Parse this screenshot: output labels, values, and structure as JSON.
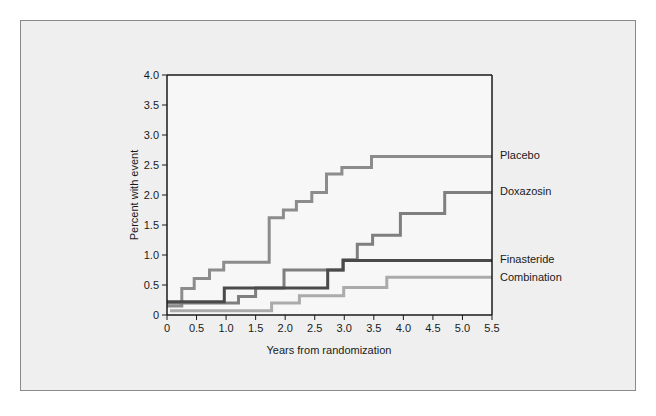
{
  "chart_data": {
    "type": "line",
    "subtype": "step (Kaplan-Meier cumulative incidence)",
    "title": "",
    "xlabel": "Years from randomization",
    "ylabel": "Percent with event",
    "xlim": [
      0,
      5.5
    ],
    "ylim": [
      0,
      4.0
    ],
    "x_ticks": [
      "0",
      "0.5",
      "1.0",
      "1.5",
      "2.0",
      "2.5",
      "3.0",
      "3.5",
      "4.0",
      "4.5",
      "5.0",
      "5.5"
    ],
    "y_ticks": [
      "0",
      "0.5",
      "1.0",
      "1.5",
      "2.0",
      "2.5",
      "3.0",
      "3.5",
      "4.0"
    ],
    "grid": false,
    "legend_position": "right, labels at line ends",
    "series": [
      {
        "name": "Placebo",
        "color": "#8c8c8c",
        "steps": [
          [
            0,
            0.15
          ],
          [
            0.25,
            0.44
          ],
          [
            0.46,
            0.61
          ],
          [
            0.72,
            0.75
          ],
          [
            0.96,
            0.88
          ],
          [
            1.73,
            1.62
          ],
          [
            1.97,
            1.75
          ],
          [
            2.19,
            1.89
          ],
          [
            2.45,
            2.04
          ],
          [
            2.7,
            2.35
          ],
          [
            2.96,
            2.46
          ],
          [
            3.46,
            2.64
          ],
          [
            5.5,
            2.64
          ]
        ]
      },
      {
        "name": "Doxazosin",
        "color": "#7f7f7f",
        "steps": [
          [
            0,
            0.2
          ],
          [
            1.21,
            0.31
          ],
          [
            1.5,
            0.45
          ],
          [
            1.98,
            0.75
          ],
          [
            2.98,
            0.92
          ],
          [
            3.22,
            1.18
          ],
          [
            3.48,
            1.33
          ],
          [
            3.95,
            1.69
          ],
          [
            4.7,
            2.04
          ],
          [
            5.5,
            2.04
          ]
        ]
      },
      {
        "name": "Finasteride",
        "color": "#4a4a4a",
        "steps": [
          [
            0,
            0.22
          ],
          [
            0.97,
            0.45
          ],
          [
            2.72,
            0.75
          ],
          [
            2.98,
            0.91
          ],
          [
            5.5,
            0.91
          ]
        ]
      },
      {
        "name": "Combination",
        "color": "#ababab",
        "steps": [
          [
            0.05,
            0.07
          ],
          [
            1.77,
            0.2
          ],
          [
            2.24,
            0.32
          ],
          [
            2.99,
            0.46
          ],
          [
            3.72,
            0.63
          ],
          [
            5.5,
            0.63
          ]
        ]
      }
    ]
  }
}
